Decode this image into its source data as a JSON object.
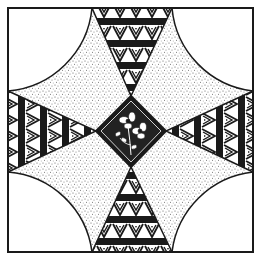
{
  "image": {
    "title": "Quilt block illustration",
    "description": "Square framed quilt block with four white corner quarter-circles, four stippled curved patches, four patterned triangles pointing inward, and a central floral diamond",
    "motifs": {
      "corners": "plain-white-quarter-circle",
      "patches": "stippled-dots",
      "triangles": "greek-key-zigzag-bands",
      "center": "floral-diamond"
    },
    "colors": {
      "ink": "#1a1a1a",
      "paper": "#ffffff",
      "stipple": "#555555"
    }
  }
}
